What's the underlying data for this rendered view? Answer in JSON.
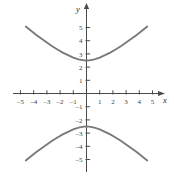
{
  "figure": {
    "name": "hyperbola-graph",
    "background_color": "#ffffff",
    "axis_color": "#4a4a4a",
    "curve_color": "#7a7a7a",
    "label_color": "#3d3d3d"
  },
  "axes": {
    "x_label": "x",
    "y_label": "y",
    "x_ticks": [
      {
        "value": -5,
        "label": "–5"
      },
      {
        "value": -4,
        "label": "–4"
      },
      {
        "value": -3,
        "label": "–3"
      },
      {
        "value": -2,
        "label": "–2"
      },
      {
        "value": -1,
        "label": "–1"
      },
      {
        "value": 1,
        "label": "1"
      },
      {
        "value": 2,
        "label": "2"
      },
      {
        "value": 3,
        "label": "3"
      },
      {
        "value": 4,
        "label": "4"
      },
      {
        "value": 5,
        "label": "5"
      }
    ],
    "y_ticks": [
      {
        "value": 5,
        "label": "5"
      },
      {
        "value": 4,
        "label": "4"
      },
      {
        "value": 3,
        "label": "3"
      },
      {
        "value": 2,
        "label": "2"
      },
      {
        "value": 1,
        "label": "1"
      },
      {
        "value": -1,
        "label": "–1"
      },
      {
        "value": -2,
        "label": "–2"
      },
      {
        "value": -3,
        "label": "–3"
      },
      {
        "value": -4,
        "label": "–4"
      },
      {
        "value": -5,
        "label": "–5"
      }
    ]
  },
  "chart_data": {
    "type": "line",
    "title": "",
    "subtitle": "",
    "xlabel": "x",
    "ylabel": "y",
    "xlim": [
      -5.6,
      5.6
    ],
    "ylim": [
      -5.6,
      5.6
    ],
    "grid": false,
    "legend": false,
    "legend_position": "none",
    "equation": "y = ±2√(1 + x²/15.2)",
    "series": [
      {
        "name": "upper-branch",
        "x": [
          -4.6,
          -4.2,
          -3.8,
          -3.4,
          -3.0,
          -2.6,
          -2.2,
          -1.8,
          -1.4,
          -1.0,
          -0.6,
          -0.2,
          0.0,
          0.2,
          0.6,
          1.0,
          1.4,
          1.8,
          2.2,
          2.6,
          3.0,
          3.4,
          3.8,
          4.2,
          4.6
        ],
        "y": [
          5.07,
          4.75,
          4.44,
          4.14,
          3.86,
          3.58,
          3.33,
          3.1,
          2.9,
          2.72,
          2.58,
          2.51,
          2.5,
          2.51,
          2.58,
          2.72,
          2.9,
          3.1,
          3.33,
          3.58,
          3.86,
          4.14,
          4.44,
          4.75,
          5.07
        ]
      },
      {
        "name": "lower-branch",
        "x": [
          -4.6,
          -4.2,
          -3.8,
          -3.4,
          -3.0,
          -2.6,
          -2.2,
          -1.8,
          -1.4,
          -1.0,
          -0.6,
          -0.2,
          0.0,
          0.2,
          0.6,
          1.0,
          1.4,
          1.8,
          2.2,
          2.6,
          3.0,
          3.4,
          3.8,
          4.2,
          4.6
        ],
        "y": [
          -5.07,
          -4.75,
          -4.44,
          -4.14,
          -3.86,
          -3.58,
          -3.33,
          -3.1,
          -2.9,
          -2.72,
          -2.58,
          -2.51,
          -2.5,
          -2.51,
          -2.58,
          -2.72,
          -2.9,
          -3.1,
          -3.33,
          -3.58,
          -3.86,
          -4.14,
          -4.44,
          -4.75,
          -5.07
        ]
      }
    ],
    "vertices": [
      {
        "x": 0,
        "y": 2
      },
      {
        "x": 0,
        "y": -2
      }
    ]
  }
}
